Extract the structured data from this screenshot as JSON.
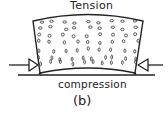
{
  "diagram": {
    "top_label": "Tension",
    "bottom_label": "compression",
    "figure_label": "(b)",
    "colors": {
      "stroke": "#222222",
      "background": "#ffffff"
    },
    "elements": {
      "block": "curved beam segment filled with aggregate dots",
      "left_arrow": "compressive force arrow pointing right",
      "right_arrow": "compressive force arrow pointing left",
      "support_line": "horizontal base line"
    }
  }
}
